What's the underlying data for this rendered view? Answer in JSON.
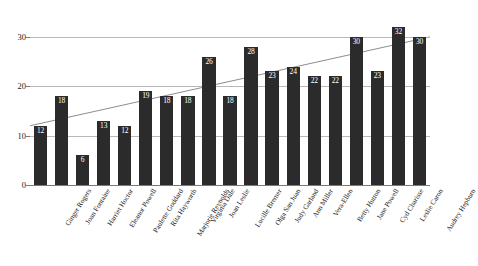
{
  "chart_data": {
    "type": "bar",
    "title": "",
    "subtitle": "",
    "xlabel": "",
    "ylabel": "",
    "ylim": [
      0,
      32
    ],
    "yticks": [
      0,
      10,
      20,
      30
    ],
    "grid": true,
    "legend": false,
    "legend_position": "none",
    "bar_color": "#2b2b2b",
    "gridline_color": "#b9b9b9",
    "trendline_color": "#8c8c8c",
    "value_label_color": "#ffffff",
    "categories": [
      "Ginger Rogers",
      "Joan Fontaine",
      "Harriet Hoctor",
      "Eleanor Powell",
      "Paulette Goddard",
      "Rita Hayworth",
      "Marjorie Reynolds",
      "Virginia Dale",
      "Joan Leslie",
      "Lucille Bremer",
      "Olga San Juan",
      "Judy Garland",
      "Ann Miller",
      "Vera-Ellen",
      "Betty Hutton",
      "Jane Powell",
      "Cyd Charisse",
      "Leslie Caron",
      "Audrey Hepburn"
    ],
    "values": [
      12,
      18,
      6,
      13,
      12,
      19,
      18,
      18,
      26,
      18,
      28,
      23,
      24,
      22,
      22,
      30,
      23,
      32,
      30
    ],
    "annotations": {
      "trendline": {
        "type": "linear",
        "start_value": 12,
        "end_value": 30
      }
    }
  }
}
